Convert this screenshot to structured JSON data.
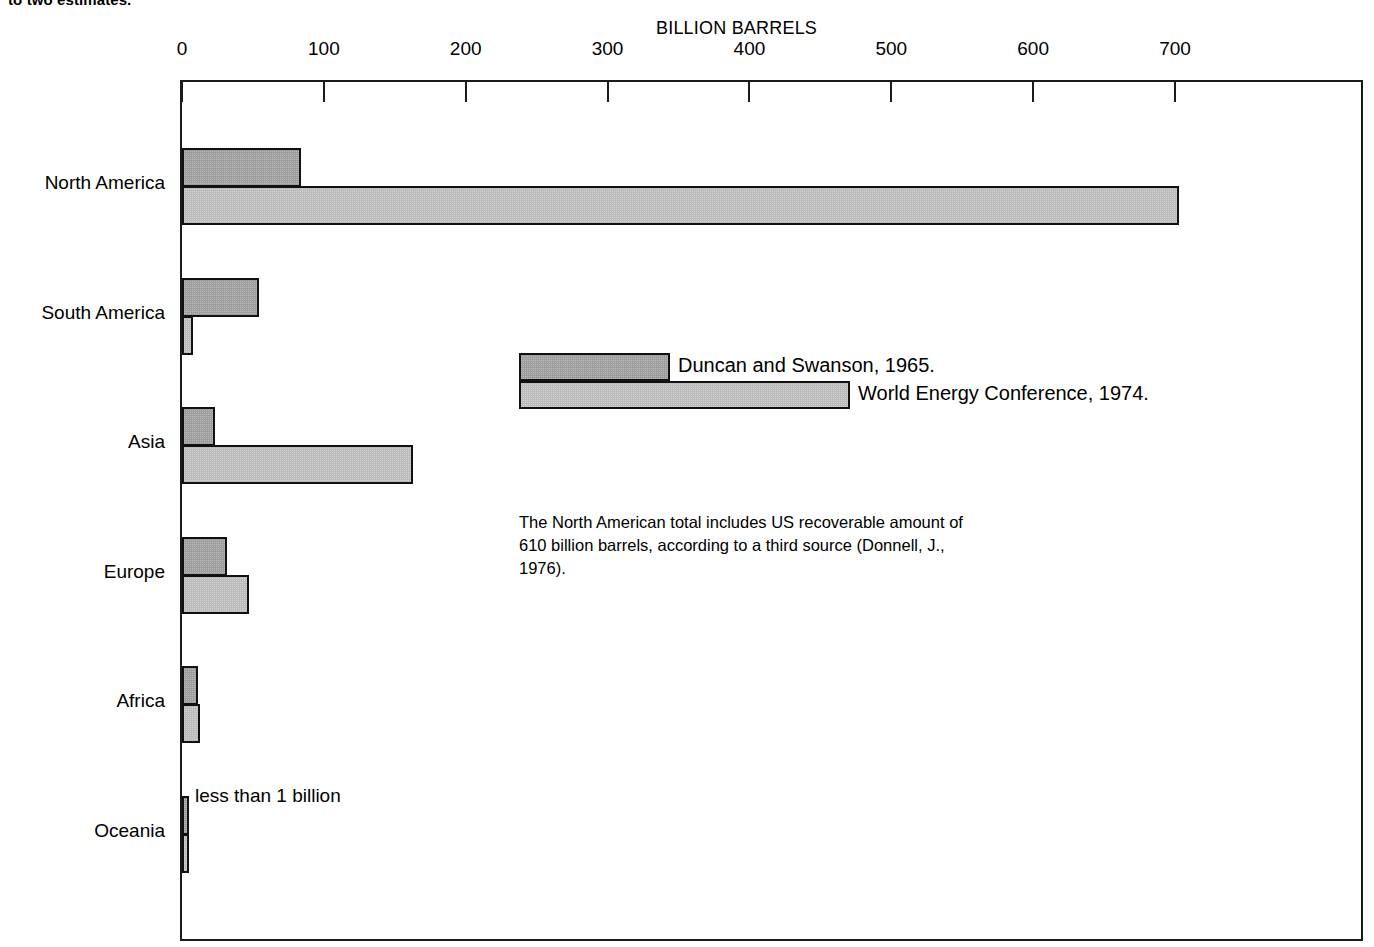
{
  "caption_fragment": "to two estimates.",
  "chart_data": {
    "type": "bar",
    "orientation": "horizontal",
    "title": "",
    "xlabel": "BILLION BARRELS",
    "ylabel": "",
    "xlim": [
      0,
      830
    ],
    "xticks": [
      0,
      100,
      200,
      300,
      400,
      500,
      600,
      700
    ],
    "xtick_labels": [
      "0",
      "100",
      "200",
      "300",
      "400",
      "500",
      "600",
      "700"
    ],
    "grid": false,
    "legend_position": "inside-center",
    "categories": [
      "North America",
      "South America",
      "Asia",
      "Europe",
      "Africa",
      "Oceania"
    ],
    "series": [
      {
        "name": "Duncan and Swanson, 1965.",
        "color": "#9d9d9d",
        "values": [
          84,
          54,
          23,
          32,
          11,
          0.5
        ]
      },
      {
        "name": "World Energy Conference, 1974.",
        "color": "#bcbcbc",
        "values": [
          703,
          8,
          163,
          47,
          13,
          0.5
        ]
      }
    ],
    "annotations": [
      {
        "name": "oceania-note",
        "text": "less than 1 billion",
        "category": "Oceania"
      },
      {
        "name": "north-america-footnote",
        "text": "The North American total includes US recoverable amount of 610 billion barrels, according to a third source (Donnell, J., 1976)."
      }
    ]
  }
}
